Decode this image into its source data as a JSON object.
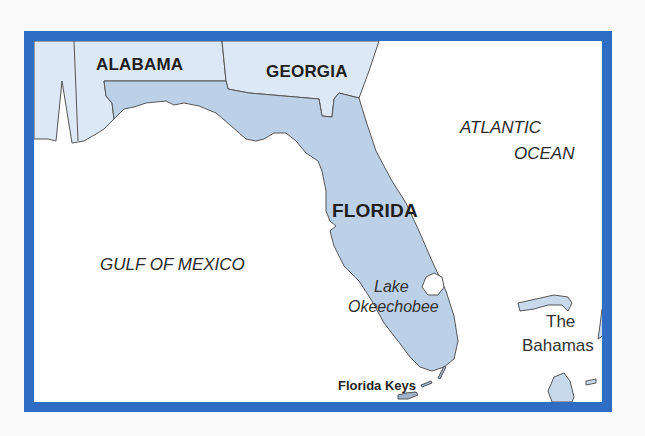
{
  "map": {
    "colors": {
      "frame": "#2f6cc4",
      "florida_fill": "#bcd0e8",
      "neighbor_fill": "#dce8f5",
      "water": "#ffffff",
      "outline": "#555555",
      "island_fill": "#c8d9ec"
    },
    "labels": {
      "alabama": "ALABAMA",
      "georgia": "GEORGIA",
      "florida": "FLORIDA",
      "atlantic_line1": "ATLANTIC",
      "atlantic_line2": "OCEAN",
      "gulf": "GULF OF MEXICO",
      "lake_line1": "Lake",
      "lake_line2": "Okeechobee",
      "keys": "Florida Keys",
      "bahamas_line1": "The",
      "bahamas_line2": "Bahamas"
    }
  }
}
